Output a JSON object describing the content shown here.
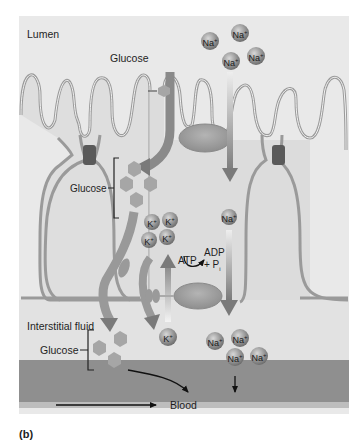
{
  "diagram": {
    "labels": {
      "lumen": "Lumen",
      "glucose_top": "Glucose",
      "glucose_mid": "Glucose",
      "interstitial": "Interstitial fluid",
      "glucose_bottom": "Glucose",
      "blood": "Blood",
      "atp": "ATP",
      "adp": "ADP",
      "pi": "+ P",
      "pi_sub": "i",
      "figure": "(b)"
    },
    "ions": {
      "na": "Na",
      "k": "K",
      "charge": "+"
    },
    "colors": {
      "background": "#e8e8e8",
      "lumen": "#ececec",
      "cell": "#dcdcdc",
      "membrane": "#9a9a9a",
      "blood": "#8c8c8c",
      "arrow": "#7a7a7a",
      "glucose": "#a8a8a8",
      "ion": "#8a8a8a",
      "transporter": "#9e9e9e",
      "junction": "#5a5a5a"
    }
  }
}
